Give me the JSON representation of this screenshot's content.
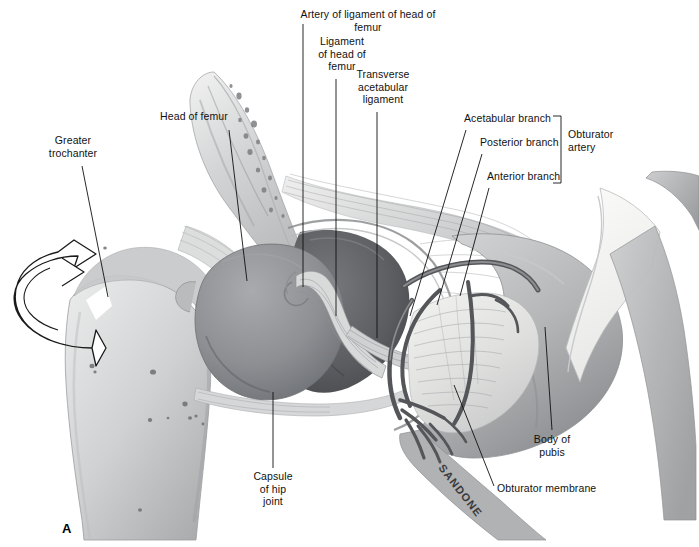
{
  "figure": {
    "panel_label": "A",
    "artist_signature": "SANDONE",
    "type": "anatomical-illustration",
    "background_color": "#ffffff",
    "ink_color": "#111111"
  },
  "labels": [
    {
      "id": "artery-of-ligament-of-head-of-femur",
      "text": "Artery of ligament of head of femur",
      "x": 288,
      "y": 8,
      "width": 160,
      "align": "center",
      "leader": {
        "type": "line",
        "x1": 303,
        "y1": 24,
        "x2": 303,
        "y2": 287
      }
    },
    {
      "id": "ligament-of-head-of-femur",
      "text": "Ligament\nof head of\nfemur",
      "x": 306,
      "y": 35,
      "width": 72,
      "align": "center",
      "leader": {
        "type": "line",
        "x1": 336,
        "y1": 79,
        "x2": 336,
        "y2": 316
      }
    },
    {
      "id": "transverse-acetabular-ligament",
      "text": "Transverse\nacetabular\nligament",
      "x": 348,
      "y": 68,
      "width": 70,
      "align": "center",
      "leader": {
        "type": "line",
        "x1": 377,
        "y1": 112,
        "x2": 377,
        "y2": 338
      }
    },
    {
      "id": "head-of-femur",
      "text": "Head of femur",
      "x": 153,
      "y": 110,
      "width": 82,
      "align": "center",
      "leader": {
        "type": "line",
        "x1": 229,
        "y1": 130,
        "x2": 247,
        "y2": 281
      }
    },
    {
      "id": "greater-trochanter",
      "text": "Greater\ntrochanter",
      "x": 41,
      "y": 134,
      "width": 64,
      "align": "center",
      "leader": {
        "type": "line",
        "x1": 82,
        "y1": 166,
        "x2": 108,
        "y2": 297
      }
    },
    {
      "id": "acetabular-branch",
      "text": "Acetabular branch",
      "x": 464,
      "y": 112,
      "width": 96,
      "align": "left",
      "leader": {
        "type": "line",
        "x1": 466,
        "y1": 130,
        "x2": 410,
        "y2": 316
      }
    },
    {
      "id": "posterior-branch",
      "text": "Posterior branch",
      "x": 480,
      "y": 136,
      "width": 86,
      "align": "left",
      "leader": {
        "type": "line",
        "x1": 482,
        "y1": 154,
        "x2": 437,
        "y2": 305
      }
    },
    {
      "id": "anterior-branch",
      "text": "Anterior branch",
      "x": 487,
      "y": 170,
      "width": 82,
      "align": "left",
      "leader": {
        "type": "line",
        "x1": 489,
        "y1": 188,
        "x2": 460,
        "y2": 296
      }
    },
    {
      "id": "obturator-artery",
      "text": "Obturator\nartery",
      "x": 568,
      "y": 128,
      "width": 58,
      "align": "left",
      "leader": {
        "type": "bracket",
        "x": 561,
        "y1": 116,
        "y2": 183,
        "tick": 8
      }
    },
    {
      "id": "body-of-pubis",
      "text": "Body of\npubis",
      "x": 524,
      "y": 433,
      "width": 56,
      "align": "center",
      "leader": {
        "type": "line",
        "x1": 552,
        "y1": 430,
        "x2": 545,
        "y2": 327
      }
    },
    {
      "id": "obturator-membrane",
      "text": "Obturator membrane",
      "x": 497,
      "y": 482,
      "width": 110,
      "align": "left",
      "leader": {
        "type": "line",
        "x1": 494,
        "y1": 486,
        "x2": 454,
        "y2": 385
      }
    },
    {
      "id": "capsule-of-hip-joint",
      "text": "Capsule\nof hip\njoint",
      "x": 247,
      "y": 470,
      "width": 52,
      "align": "center",
      "leader": {
        "type": "line",
        "x1": 273,
        "y1": 468,
        "x2": 273,
        "y2": 392
      }
    }
  ],
  "structures": [
    {
      "name": "ilium",
      "tone": "#cfd0d1"
    },
    {
      "name": "acetabular-fossa",
      "tone": "#6d6e72"
    },
    {
      "name": "head-of-femur",
      "tone": "#8f9195"
    },
    {
      "name": "greater-trochanter",
      "tone": "#bdbfc1"
    },
    {
      "name": "femoral-shaft",
      "tone": "#d3d4d5"
    },
    {
      "name": "obturator-membrane",
      "tone": "#e4e4e3"
    },
    {
      "name": "body-of-pubis",
      "tone": "#b9babc"
    },
    {
      "name": "cut-bone-surface",
      "tone": "#f4f4f3"
    },
    {
      "name": "obturator-vessels",
      "tone": "#5b5c60"
    },
    {
      "name": "rotation-arrow",
      "tone": "#ffffff"
    }
  ]
}
